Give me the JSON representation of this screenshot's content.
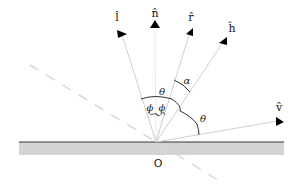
{
  "diagram": {
    "origin_label": "O",
    "vectors": [
      {
        "id": "l",
        "label": "l̂",
        "name": "light-direction"
      },
      {
        "id": "n",
        "label": "n̂",
        "name": "surface-normal"
      },
      {
        "id": "r",
        "label": "r̂",
        "name": "reflection-direction"
      },
      {
        "id": "h",
        "label": "ĥ",
        "name": "halfway-vector"
      },
      {
        "id": "v",
        "label": "v̂",
        "name": "view-direction"
      }
    ],
    "angles": {
      "phi_left": "ϕ",
      "phi_right": "ϕ",
      "theta_top": "θ",
      "theta_right": "θ",
      "alpha": "α"
    },
    "colors": {
      "surface_band": "#d4d4d4",
      "surface_line": "#333333",
      "ray": "#cfcfcf",
      "dashed": "#d8d8d8",
      "arrowhead": "#000000",
      "arc": "#333333"
    }
  }
}
